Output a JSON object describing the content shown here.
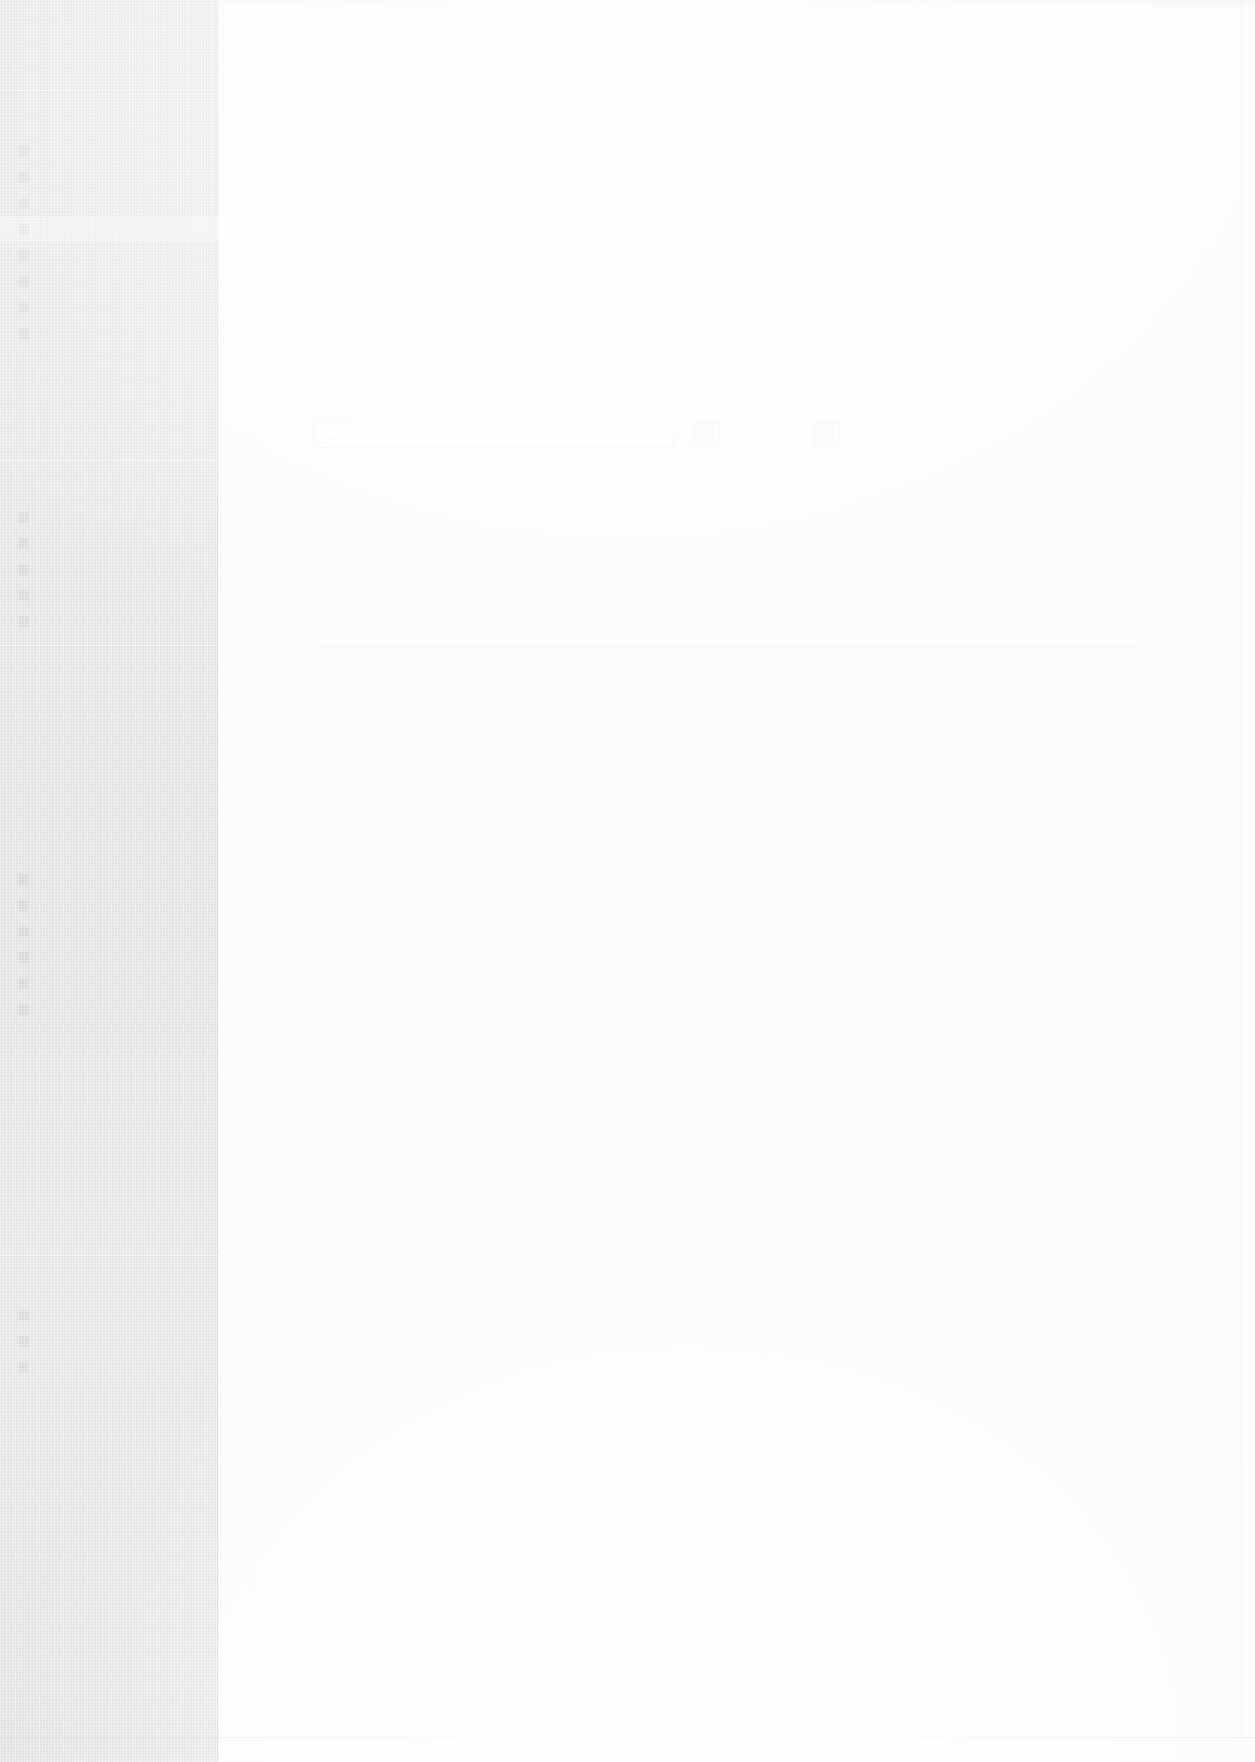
{
  "meta": {
    "note_visible_text": "The source screenshot is almost entirely washed out; text is below the legibility threshold and is reproduced as ghost placeholders.",
    "canvas": {
      "width": 1255,
      "height": 1762
    },
    "colors": {
      "sidebar_bg": "#e9e9e9",
      "content_bg": "#fefefe",
      "divider": "#ffffff",
      "hairline": "#000000"
    }
  },
  "sidebar": {
    "width_px": 218,
    "brand": {
      "label": ""
    },
    "dividers_y": [
      90,
      460,
      645,
      1255
    ],
    "sections": [
      {
        "name": "primary",
        "header": {
          "label": ""
        },
        "items": [
          {
            "label": "",
            "icon": "square-icon",
            "active": false
          },
          {
            "label": "",
            "icon": "square-icon",
            "active": false
          },
          {
            "label": "",
            "icon": "square-icon",
            "active": false
          },
          {
            "label": "",
            "icon": "square-icon",
            "active": true
          },
          {
            "label": "",
            "icon": "square-icon",
            "active": false
          },
          {
            "label": "",
            "icon": "square-icon",
            "active": false
          },
          {
            "label": "",
            "icon": "square-icon",
            "active": false
          },
          {
            "label": "",
            "icon": "square-icon",
            "active": false
          }
        ]
      },
      {
        "name": "secondary",
        "header": {
          "label": ""
        },
        "items": [
          {
            "label": "",
            "icon": "square-icon",
            "active": false
          },
          {
            "label": "",
            "icon": "square-icon",
            "active": false
          },
          {
            "label": "",
            "icon": "square-icon",
            "active": false
          },
          {
            "label": "",
            "icon": "square-icon",
            "active": false
          },
          {
            "label": "",
            "icon": "square-icon",
            "active": false
          }
        ]
      },
      {
        "name": "tertiary",
        "header": {
          "label": ""
        },
        "items": [
          {
            "label": "",
            "icon": "square-icon",
            "active": false
          },
          {
            "label": "",
            "icon": "square-icon",
            "active": false
          },
          {
            "label": "",
            "icon": "square-icon",
            "active": false
          },
          {
            "label": "",
            "icon": "square-icon",
            "active": false
          },
          {
            "label": "",
            "icon": "square-icon",
            "active": false
          },
          {
            "label": "",
            "icon": "square-icon",
            "active": false
          }
        ]
      },
      {
        "name": "footer",
        "header": {
          "label": ""
        },
        "items": [
          {
            "label": "",
            "icon": "square-icon",
            "active": false
          },
          {
            "label": "",
            "icon": "square-icon",
            "active": false
          },
          {
            "label": "",
            "icon": "square-icon",
            "active": false
          }
        ]
      }
    ]
  },
  "content": {
    "topbar": {
      "label": ""
    },
    "heading": {
      "title": "",
      "subtitle": ""
    },
    "paragraphs": [
      {
        "text": ""
      },
      {
        "text": ""
      },
      {
        "text": ""
      },
      {
        "text": ""
      },
      {
        "text": ""
      },
      {
        "text": ""
      }
    ],
    "search": {
      "value": "",
      "placeholder": "",
      "icon": "search-icon"
    },
    "actions": [
      {
        "label": ""
      },
      {
        "label": ""
      }
    ],
    "section_heading": {
      "text": ""
    },
    "table": {
      "columns": [
        "",
        "",
        "",
        "",
        ""
      ],
      "rows": [
        [
          "",
          "",
          "",
          "",
          ""
        ],
        [
          "",
          "",
          "",
          "",
          ""
        ],
        [
          "",
          "",
          "",
          "",
          ""
        ],
        [
          "",
          "",
          "",
          "",
          ""
        ],
        [
          "",
          "",
          "",
          "",
          ""
        ],
        [
          "",
          "",
          "",
          "",
          ""
        ],
        [
          "",
          "",
          "",
          "",
          ""
        ],
        [
          "",
          "",
          "",
          "",
          ""
        ]
      ]
    },
    "footer_note": {
      "text": ""
    }
  }
}
